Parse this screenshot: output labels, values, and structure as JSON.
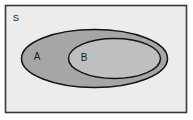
{
  "diagram": {
    "type": "venn",
    "relation": "B is a subset of A",
    "universe": {
      "name": "S",
      "label": "S",
      "shape": "rectangle",
      "fill_color": "#ececec",
      "stroke_color": "#3a3a3a"
    },
    "sets": [
      {
        "name": "A",
        "label": "A",
        "shape": "ellipse",
        "fill_color": "#a6a6a6",
        "stroke_color": "#141414",
        "cx": 94.5,
        "cy": 58.5,
        "rx": 73,
        "ry": 29,
        "label_x": 37,
        "label_y": 57
      },
      {
        "name": "B",
        "label": "B",
        "shape": "ellipse",
        "fill_color": "#bfbfbf",
        "stroke_color": "#141414",
        "cx": 114.5,
        "cy": 58.5,
        "rx": 46,
        "ry": 20,
        "label_x": 84,
        "label_y": 58
      }
    ],
    "universe_label_x": 16,
    "universe_label_y": 18,
    "canvas": {
      "width": 193,
      "height": 120,
      "rect_x": 5.5,
      "rect_y": 5.5,
      "rect_width": 181,
      "rect_height": 107
    },
    "colors": {
      "page_background": "#ffffff",
      "universe_fill": "#ececec",
      "set_a_fill": "#a6a6a6",
      "set_b_fill": "#bfbfbf",
      "outline": "#141414",
      "rect_border": "#3a3a3a",
      "text": "#1a1a1a"
    }
  }
}
